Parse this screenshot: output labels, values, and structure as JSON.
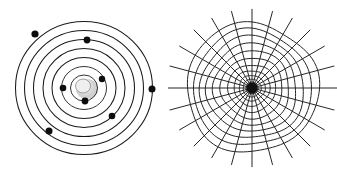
{
  "figure": {
    "background_color": "#ffffff",
    "width": 337,
    "height": 176,
    "panel_count": 2
  },
  "panels": [
    {
      "id": "left",
      "name": "bohr-atom-diagram",
      "label": "Concentric orbital shells with electrons",
      "stroke_color": "#1a1a1a",
      "center": {
        "x": 84,
        "y": 88
      },
      "nucleus": {
        "label": "nucleus",
        "fill_color": "#c9c9c9",
        "core_fill": "#efefef",
        "radius": 11,
        "offset_x": 2,
        "offset_y": 0
      },
      "orbits": [
        {
          "index": 1,
          "rx": 13.5,
          "ry": 13.0
        },
        {
          "index": 2,
          "rx": 22.5,
          "ry": 21.5
        },
        {
          "index": 3,
          "rx": 32.0,
          "ry": 30.5
        },
        {
          "index": 4,
          "rx": 41.0,
          "ry": 39.5
        },
        {
          "index": 5,
          "rx": 50.5,
          "ry": 48.5
        },
        {
          "index": 6,
          "rx": 59.5,
          "ry": 57.5
        },
        {
          "index": 7,
          "rx": 68.5,
          "ry": 66.5
        }
      ],
      "electrons": [
        {
          "id": "e1",
          "x": 85,
          "y": 101,
          "r": 3.4,
          "orbit": 1
        },
        {
          "id": "e2",
          "x": 102,
          "y": 79,
          "r": 3.2,
          "orbit": 2
        },
        {
          "id": "e3",
          "x": 63,
          "y": 88,
          "r": 3.3,
          "orbit": 2
        },
        {
          "id": "e4",
          "x": 112,
          "y": 116,
          "r": 3.3,
          "orbit": 3
        },
        {
          "id": "e5",
          "x": 87,
          "y": 40,
          "r": 3.4,
          "orbit": 5
        },
        {
          "id": "e6",
          "x": 35,
          "y": 34,
          "r": 3.6,
          "orbit": 6
        },
        {
          "id": "e7",
          "x": 49,
          "y": 131,
          "r": 3.5,
          "orbit": 5
        },
        {
          "id": "e8",
          "x": 152,
          "y": 89,
          "r": 3.5,
          "orbit": 7
        }
      ]
    },
    {
      "id": "right",
      "name": "polar-web-grid",
      "label": "Radial spoke and concentric ring web grid",
      "stroke_color": "#262626",
      "center": {
        "x": 84,
        "y": 88
      },
      "spoke_count": 24,
      "spoke_angle_step_deg": 15,
      "spoke_length": 82,
      "hub_radius": 5.5,
      "rings": [
        {
          "index": 1,
          "r": 6
        },
        {
          "index": 2,
          "r": 9
        },
        {
          "index": 3,
          "r": 13
        },
        {
          "index": 4,
          "r": 18
        },
        {
          "index": 5,
          "r": 24
        },
        {
          "index": 6,
          "r": 31
        },
        {
          "index": 7,
          "r": 38
        },
        {
          "index": 8,
          "r": 45
        },
        {
          "index": 9,
          "r": 52
        },
        {
          "index": 10,
          "r": 59
        },
        {
          "index": 11,
          "r": 66
        }
      ]
    }
  ]
}
